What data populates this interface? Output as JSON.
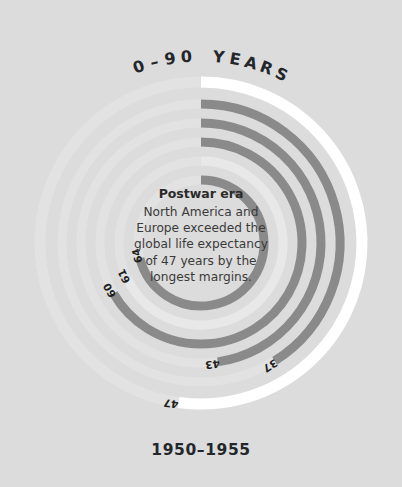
{
  "background_color": "#dcdcdc",
  "header": {
    "scale_label": "0–90 YEARS"
  },
  "footer": {
    "period_label": "1950–1955"
  },
  "annotation": {
    "title": "Postwar era",
    "line1": "North America and",
    "line2": "Europe exceeded the",
    "line3": "global life expectancy",
    "line4": "of 47 years by the",
    "line5": "longest margins."
  },
  "chart_data": {
    "type": "bar",
    "subtype": "radial-bar",
    "subtitle": "1950–1955",
    "xlabel": "",
    "ylabel": "Life expectancy (years)",
    "value_range": [
      0,
      90
    ],
    "start_angle_deg": 0,
    "direction": "clockwise",
    "grid": false,
    "legend": false,
    "track_color": "#e4e4e4",
    "categories": [
      "37",
      "43",
      "47",
      "60",
      "61",
      "64"
    ],
    "values": [
      37,
      43,
      47,
      60,
      61,
      64
    ],
    "series": [
      {
        "name": "1950-1955",
        "values": [
          37,
          43,
          47,
          60,
          61,
          64
        ]
      }
    ],
    "bars": [
      {
        "label": "64",
        "value": 64,
        "radius": 63,
        "thickness": 9,
        "color": "#8a8a8a",
        "track": "#e3e3e3"
      },
      {
        "label": "61",
        "value": 61,
        "radius": 82,
        "thickness": 9,
        "color": "#e8e8e8",
        "track": "#e3e3e3"
      },
      {
        "label": "60",
        "value": 60,
        "radius": 101,
        "thickness": 9,
        "color": "#8a8a8a",
        "track": "#e3e3e3"
      },
      {
        "label": "43",
        "value": 43,
        "radius": 120,
        "thickness": 9,
        "color": "#8a8a8a",
        "track": "#e3e3e3"
      },
      {
        "label": "37",
        "value": 37,
        "radius": 139,
        "thickness": 9,
        "color": "#8a8a8a",
        "track": "#e3e3e3"
      },
      {
        "label": "47",
        "value": 47,
        "radius": 161,
        "thickness": 11,
        "color": "#ffffff",
        "track": "#e3e3e3"
      }
    ],
    "annotations": [
      {
        "title": "Postwar era",
        "text": "North America and Europe exceeded the global life expectancy of 47 years by the longest margins.",
        "position": "center"
      }
    ]
  }
}
